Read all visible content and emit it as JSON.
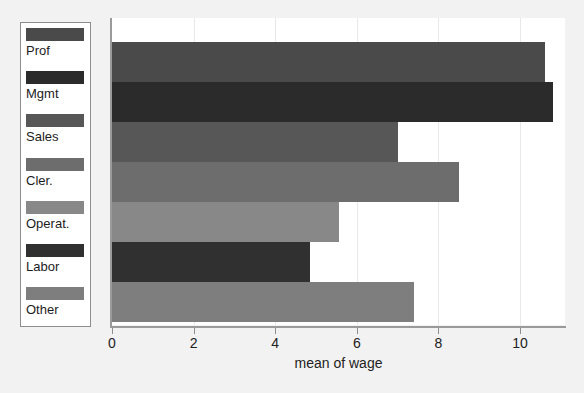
{
  "chart_data": {
    "type": "bar",
    "orientation": "horizontal",
    "title": "",
    "xlabel": "mean of wage",
    "ylabel": "",
    "categories": [
      "Prof",
      "Mgmt",
      "Sales",
      "Cler.",
      "Operat.",
      "Labor",
      "Other"
    ],
    "values": [
      10.6,
      10.8,
      7.0,
      8.5,
      5.55,
      4.85,
      7.4
    ],
    "colors": [
      "#4a4a4a",
      "#2b2b2b",
      "#575757",
      "#6d6d6d",
      "#888888",
      "#303030",
      "#7e7e7e"
    ],
    "xlim": [
      0,
      11.1
    ],
    "xticks": [
      0,
      2,
      4,
      6,
      8,
      10
    ],
    "xtick_labels": [
      "0",
      "2",
      "4",
      "6",
      "8",
      "10"
    ],
    "grid": true,
    "legend_position": "left",
    "legend_entries": [
      {
        "label": "Prof",
        "color": "#4a4a4a"
      },
      {
        "label": "Mgmt",
        "color": "#2b2b2b"
      },
      {
        "label": "Sales",
        "color": "#575757"
      },
      {
        "label": "Cler.",
        "color": "#6d6d6d"
      },
      {
        "label": "Operat.",
        "color": "#888888"
      },
      {
        "label": "Labor",
        "color": "#303030"
      },
      {
        "label": "Other",
        "color": "#7e7e7e"
      }
    ]
  },
  "figure": {
    "background_color": "#f2f2f2",
    "panel_color": "#ffffff",
    "axis_color": "#9a9a9a"
  }
}
